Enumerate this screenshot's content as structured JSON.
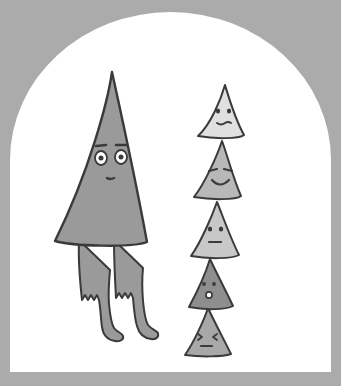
{
  "artwork": {
    "title": "Tall triangle person beside a stack of five triangle faces",
    "medium": "flat vector cartoon illustration, grayscale",
    "canvas": {
      "width": 341,
      "height": 386,
      "background_color": "#ababab",
      "frame_color": "#ffffff",
      "frame_shape": "arch",
      "frame_left": 10,
      "frame_right": 331,
      "frame_bottom": 372,
      "frame_arch_top": 12,
      "frame_arch_spring_y": 160
    },
    "ink_color": "#3a3a3a",
    "eye_white_color": "#ffffff"
  },
  "characters": [
    {
      "id": "tall-triangle-person",
      "name": "Tall Triangle Person",
      "fill_color": "#9a9a9a",
      "body": {
        "apex_x": 112,
        "apex_y": 72,
        "base_left_x": 54,
        "base_right_x": 146,
        "base_y": 243
      },
      "face": {
        "expression": "worried",
        "brow_left": {
          "x": 101,
          "y": 146
        },
        "brow_right": {
          "x": 122,
          "y": 145
        },
        "eye_left": {
          "x": 101,
          "y": 157,
          "rx": 6,
          "ry": 7
        },
        "eye_right": {
          "x": 120,
          "y": 156,
          "rx": 6,
          "ry": 7
        },
        "pupil_radius": 2.4,
        "mouth": {
          "x": 110,
          "y": 178,
          "w": 7,
          "h": 2
        }
      },
      "legs": [
        {
          "id": "leg-left",
          "top_x": 84,
          "bottom_x": 92,
          "cuff_y": 303,
          "foot_dir": "right"
        },
        {
          "id": "leg-right",
          "top_x": 120,
          "bottom_x": 124,
          "cuff_y": 300,
          "foot_dir": "right"
        }
      ],
      "detail": "two thin legs with jagged zig-zag cuffs and rounded boots"
    },
    {
      "id": "triangle-1",
      "name": "Top Triangle",
      "stack_index": 1,
      "fill_color": "#e0e0e0",
      "expression": "neutral-concerned",
      "eye_style": "dots",
      "mouth_style": "short-wavy-line",
      "geometry": {
        "apex_x": 225,
        "apex_y": 85,
        "base_left_x": 198,
        "base_right_x": 243,
        "base_y": 136
      }
    },
    {
      "id": "triangle-2",
      "name": "Second Triangle",
      "stack_index": 2,
      "fill_color": "#b8b8b8",
      "expression": "happy",
      "eye_style": "slanted-dashes",
      "mouth_style": "smile-curve",
      "geometry": {
        "apex_x": 222,
        "apex_y": 141,
        "base_left_x": 194,
        "base_right_x": 240,
        "base_y": 197
      }
    },
    {
      "id": "triangle-3",
      "name": "Third Triangle",
      "stack_index": 3,
      "fill_color": "#c8c8c8",
      "expression": "flat",
      "eye_style": "dots",
      "mouth_style": "straight-line",
      "geometry": {
        "apex_x": 217,
        "apex_y": 202,
        "base_left_x": 191,
        "base_right_x": 238,
        "base_y": 256
      }
    },
    {
      "id": "triangle-4",
      "name": "Fourth Triangle",
      "stack_index": 4,
      "fill_color": "#8e8e8e",
      "expression": "surprised",
      "eye_style": "dots",
      "mouth_style": "small-o",
      "geometry": {
        "apex_x": 210,
        "apex_y": 259,
        "base_left_x": 189,
        "base_right_x": 232,
        "base_y": 307
      }
    },
    {
      "id": "triangle-5",
      "name": "Bottom Triangle",
      "stack_index": 5,
      "fill_color": "#a8a8a8",
      "expression": "squinting",
      "eye_style": "angle-brackets",
      "mouth_style": "dash",
      "geometry": {
        "apex_x": 208,
        "apex_y": 308,
        "base_left_x": 185,
        "base_right_x": 230,
        "base_y": 355
      }
    }
  ]
}
